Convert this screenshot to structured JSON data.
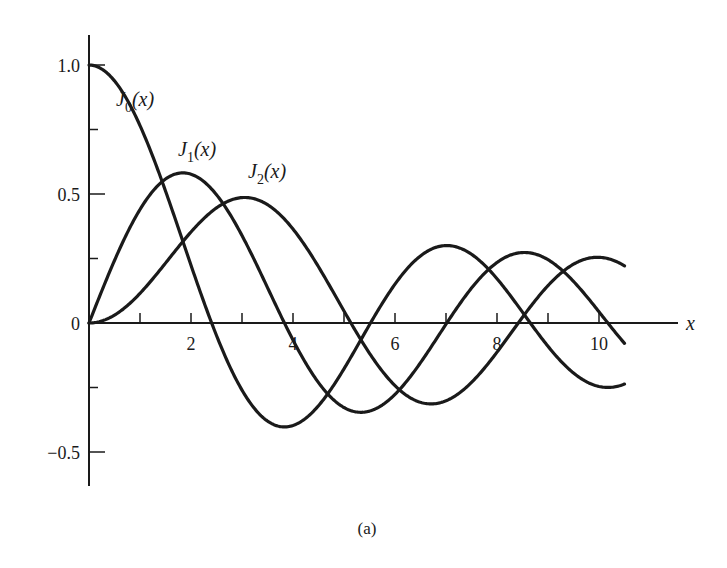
{
  "caption": "(a)",
  "chart_data": {
    "type": "line",
    "title": "",
    "xlabel": "x",
    "ylabel": "",
    "xlim": [
      0,
      11.5
    ],
    "ylim": [
      -0.63,
      1.1
    ],
    "grid": false,
    "legend": "inline labels",
    "x_ticks": [
      {
        "value": 0,
        "label": ""
      },
      {
        "value": 1,
        "label": ""
      },
      {
        "value": 2,
        "label": "2"
      },
      {
        "value": 3,
        "label": ""
      },
      {
        "value": 4,
        "label": "4"
      },
      {
        "value": 5,
        "label": ""
      },
      {
        "value": 6,
        "label": "6"
      },
      {
        "value": 7,
        "label": ""
      },
      {
        "value": 8,
        "label": "8"
      },
      {
        "value": 9,
        "label": ""
      },
      {
        "value": 10,
        "label": "10"
      }
    ],
    "y_ticks": [
      {
        "value": 1.0,
        "label": "1.0"
      },
      {
        "value": 0.75,
        "label": ""
      },
      {
        "value": 0.5,
        "label": "0.5"
      },
      {
        "value": 0.25,
        "label": ""
      },
      {
        "value": 0,
        "label": "0"
      },
      {
        "value": -0.25,
        "label": ""
      },
      {
        "value": -0.5,
        "label": "−0.5"
      }
    ],
    "x": [
      0,
      0.5,
      1,
      1.5,
      2,
      2.5,
      3,
      3.5,
      4,
      4.5,
      5,
      5.5,
      6,
      6.5,
      7,
      7.5,
      8,
      8.5,
      9,
      9.5,
      10,
      10.5
    ],
    "series": [
      {
        "name": "J0(x)",
        "label_main": "J",
        "label_sub": "0",
        "label_arg": "(x)",
        "order": 0,
        "values": [
          1,
          0.938,
          0.765,
          0.512,
          0.224,
          -0.048,
          -0.26,
          -0.38,
          -0.397,
          -0.321,
          -0.178,
          -0.007,
          0.151,
          0.26,
          0.3,
          0.266,
          0.172,
          0.042,
          -0.09,
          -0.194,
          -0.246,
          -0.237
        ]
      },
      {
        "name": "J1(x)",
        "label_main": "J",
        "label_sub": "1",
        "label_arg": "(x)",
        "order": 1,
        "values": [
          0,
          0.242,
          0.44,
          0.558,
          0.577,
          0.497,
          0.339,
          0.137,
          -0.066,
          -0.231,
          -0.328,
          -0.341,
          -0.277,
          -0.154,
          -0.005,
          0.135,
          0.235,
          0.273,
          0.245,
          0.161,
          0.043,
          -0.079
        ]
      },
      {
        "name": "J2(x)",
        "label_main": "J",
        "label_sub": "2",
        "label_arg": "(x)",
        "order": 2,
        "values": [
          0,
          0.031,
          0.115,
          0.232,
          0.353,
          0.446,
          0.486,
          0.459,
          0.364,
          0.218,
          0.047,
          -0.117,
          -0.243,
          -0.307,
          -0.301,
          -0.23,
          -0.113,
          0.022,
          0.145,
          0.228,
          0.255,
          0.222
        ]
      }
    ]
  }
}
